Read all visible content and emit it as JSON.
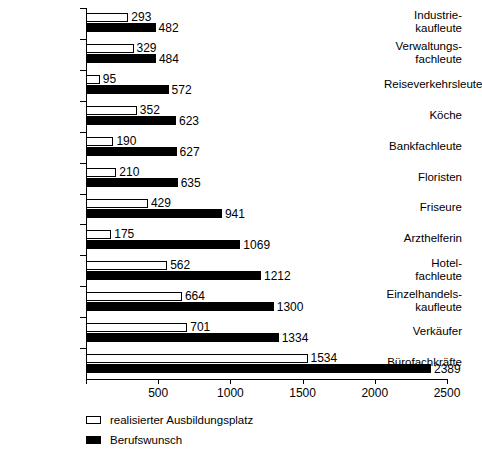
{
  "chart_data": {
    "type": "bar",
    "orientation": "horizontal",
    "title": "",
    "xlabel": "",
    "ylabel": "",
    "xlim": [
      0,
      2500
    ],
    "xticks": [
      0,
      500,
      1000,
      1500,
      2000,
      2500
    ],
    "xtick_labels": [
      "",
      "500",
      "1000",
      "1500",
      "2000",
      "2500"
    ],
    "grid": false,
    "legend_position": "bottom-left",
    "categories": [
      "Industrie-\nkaufleute",
      "Verwaltungs-\nfachleute",
      "Reiseverkehrsleute",
      "Köche",
      "Bankfachleute",
      "Floristen",
      "Friseure",
      "Arzthelferin",
      "Hotel-\nfachleute",
      "Einzelhandels-\nkaufleute",
      "Verkäufer",
      "Bürofachkräfte"
    ],
    "category_lines": [
      [
        "Industrie-",
        "kaufleute"
      ],
      [
        "Verwaltungs-",
        "fachleute"
      ],
      [
        "Reiseverkehrsleute"
      ],
      [
        "Köche"
      ],
      [
        "Bankfachleute"
      ],
      [
        "Floristen"
      ],
      [
        "Friseure"
      ],
      [
        "Arzthelferin"
      ],
      [
        "Hotel-",
        "fachleute"
      ],
      [
        "Einzelhandels-",
        "kaufleute"
      ],
      [
        "Verkäufer"
      ],
      [
        "Bürofachkräfte"
      ]
    ],
    "series": [
      {
        "name": "realisierter Ausbildungsplatz",
        "color": "#ffffff",
        "values": [
          293,
          329,
          95,
          352,
          190,
          210,
          429,
          175,
          562,
          664,
          701,
          1534
        ]
      },
      {
        "name": "Berufswunsch",
        "color": "#000000",
        "values": [
          482,
          484,
          572,
          623,
          627,
          635,
          941,
          1069,
          1212,
          1300,
          1334,
          2389
        ]
      }
    ]
  },
  "legend": {
    "items": [
      {
        "label": "realisierter Ausbildungsplatz",
        "swatch": "light"
      },
      {
        "label": "Berufswunsch",
        "swatch": "dark"
      }
    ]
  }
}
